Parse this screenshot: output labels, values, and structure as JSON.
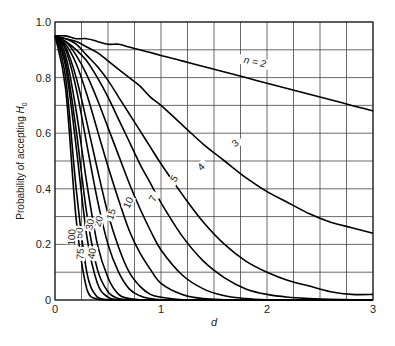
{
  "chart_data": {
    "type": "line",
    "title": "",
    "xlabel": "d",
    "ylabel": "Probability of accepting H0",
    "xlim": [
      0,
      3
    ],
    "ylim": [
      0,
      1.0
    ],
    "grid": true,
    "x_ticks": [
      "0",
      "1",
      "2",
      "3"
    ],
    "y_ticks": [
      "0",
      "0.2",
      "0.4",
      "0.6",
      "0.8",
      "1.0"
    ],
    "x_grid_step": 0.25,
    "y_grid_step": 0.1,
    "x": [
      0,
      0.1,
      0.2,
      0.3,
      0.4,
      0.5,
      0.6,
      0.7,
      0.8,
      0.9,
      1.0,
      1.2,
      1.4,
      1.6,
      1.8,
      2.0,
      2.2,
      2.4,
      2.6,
      2.8,
      3.0
    ],
    "series": [
      {
        "name": "n = 2",
        "label": "n = 2",
        "values": [
          0.95,
          0.95,
          0.94,
          0.94,
          0.93,
          0.92,
          0.92,
          0.91,
          0.9,
          0.89,
          0.88,
          0.86,
          0.84,
          0.82,
          0.8,
          0.78,
          0.76,
          0.74,
          0.72,
          0.7,
          0.68
        ]
      },
      {
        "name": "n = 3",
        "label": "3",
        "values": [
          0.95,
          0.94,
          0.93,
          0.91,
          0.89,
          0.86,
          0.83,
          0.8,
          0.77,
          0.73,
          0.7,
          0.63,
          0.56,
          0.5,
          0.44,
          0.39,
          0.35,
          0.31,
          0.28,
          0.26,
          0.24
        ]
      },
      {
        "name": "n = 4",
        "label": "4",
        "values": [
          0.95,
          0.94,
          0.92,
          0.88,
          0.84,
          0.79,
          0.73,
          0.67,
          0.61,
          0.55,
          0.49,
          0.38,
          0.28,
          0.2,
          0.14,
          0.1,
          0.07,
          0.05,
          0.03,
          0.02,
          0.02
        ]
      },
      {
        "name": "n = 5",
        "label": "5",
        "values": [
          0.95,
          0.93,
          0.9,
          0.86,
          0.8,
          0.73,
          0.65,
          0.57,
          0.49,
          0.42,
          0.35,
          0.23,
          0.14,
          0.08,
          0.04,
          0.02,
          0.01,
          0.005,
          0.002,
          0.001,
          0.0
        ]
      },
      {
        "name": "n = 7",
        "label": "7",
        "values": [
          0.95,
          0.93,
          0.88,
          0.81,
          0.72,
          0.62,
          0.52,
          0.42,
          0.33,
          0.25,
          0.18,
          0.09,
          0.04,
          0.015,
          0.005,
          0.001,
          0.0,
          0.0,
          0.0,
          0.0,
          0.0
        ]
      },
      {
        "name": "n = 10",
        "label": "10",
        "values": [
          0.95,
          0.92,
          0.85,
          0.74,
          0.61,
          0.48,
          0.36,
          0.25,
          0.17,
          0.11,
          0.06,
          0.02,
          0.005,
          0.001,
          0.0,
          0.0,
          0.0,
          0.0,
          0.0,
          0.0,
          0.0
        ]
      },
      {
        "name": "n = 15",
        "label": "15",
        "values": [
          0.95,
          0.91,
          0.8,
          0.64,
          0.47,
          0.31,
          0.19,
          0.1,
          0.05,
          0.02,
          0.01,
          0.001,
          0.0,
          0.0,
          0.0,
          0.0,
          0.0,
          0.0,
          0.0,
          0.0,
          0.0
        ]
      },
      {
        "name": "n = 20",
        "label": "20",
        "values": [
          0.95,
          0.9,
          0.76,
          0.56,
          0.36,
          0.2,
          0.1,
          0.04,
          0.015,
          0.005,
          0.001,
          0.0,
          0.0,
          0.0,
          0.0,
          0.0,
          0.0,
          0.0,
          0.0,
          0.0,
          0.0
        ]
      },
      {
        "name": "n = 30",
        "label": "30",
        "values": [
          0.95,
          0.88,
          0.68,
          0.42,
          0.2,
          0.08,
          0.02,
          0.005,
          0.001,
          0.0,
          0.0,
          0.0,
          0.0,
          0.0,
          0.0,
          0.0,
          0.0,
          0.0,
          0.0,
          0.0,
          0.0
        ]
      },
      {
        "name": "n = 40",
        "label": "40",
        "values": [
          0.95,
          0.86,
          0.61,
          0.31,
          0.11,
          0.03,
          0.005,
          0.001,
          0.0,
          0.0,
          0.0,
          0.0,
          0.0,
          0.0,
          0.0,
          0.0,
          0.0,
          0.0,
          0.0,
          0.0,
          0.0
        ]
      },
      {
        "name": "n = 50",
        "label": "50",
        "values": [
          0.95,
          0.84,
          0.55,
          0.23,
          0.06,
          0.01,
          0.001,
          0.0,
          0.0,
          0.0,
          0.0,
          0.0,
          0.0,
          0.0,
          0.0,
          0.0,
          0.0,
          0.0,
          0.0,
          0.0,
          0.0
        ]
      },
      {
        "name": "n = 75",
        "label": "75",
        "values": [
          0.95,
          0.8,
          0.4,
          0.1,
          0.01,
          0.001,
          0.0,
          0.0,
          0.0,
          0.0,
          0.0,
          0.0,
          0.0,
          0.0,
          0.0,
          0.0,
          0.0,
          0.0,
          0.0,
          0.0,
          0.0
        ]
      },
      {
        "name": "n = 100",
        "label": "100",
        "values": [
          0.95,
          0.76,
          0.29,
          0.04,
          0.003,
          0.0,
          0.0,
          0.0,
          0.0,
          0.0,
          0.0,
          0.0,
          0.0,
          0.0,
          0.0,
          0.0,
          0.0,
          0.0,
          0.0,
          0.0,
          0.0
        ]
      }
    ],
    "curve_labels": [
      {
        "text": "n = 2",
        "x": 1.88,
        "y": 0.845,
        "rot": 12
      },
      {
        "text": "3",
        "x": 1.72,
        "y": 0.555,
        "rot": -40
      },
      {
        "text": "4",
        "x": 1.4,
        "y": 0.47,
        "rot": -45
      },
      {
        "text": "5",
        "x": 1.15,
        "y": 0.43,
        "rot": -55
      },
      {
        "text": "7",
        "x": 0.95,
        "y": 0.36,
        "rot": -62
      },
      {
        "text": "10",
        "x": 0.72,
        "y": 0.345,
        "rot": -65
      },
      {
        "text": "15",
        "x": 0.56,
        "y": 0.305,
        "rot": -72
      },
      {
        "text": "20",
        "x": 0.44,
        "y": 0.28,
        "rot": -75
      },
      {
        "text": "30",
        "x": 0.36,
        "y": 0.27,
        "rot": -80
      },
      {
        "text": "40",
        "x": 0.38,
        "y": 0.165,
        "rot": -80
      },
      {
        "text": "50",
        "x": 0.26,
        "y": 0.24,
        "rot": -85
      },
      {
        "text": "75",
        "x": 0.27,
        "y": 0.165,
        "rot": -85
      },
      {
        "text": "100",
        "x": 0.19,
        "y": 0.225,
        "rot": -88
      }
    ]
  }
}
